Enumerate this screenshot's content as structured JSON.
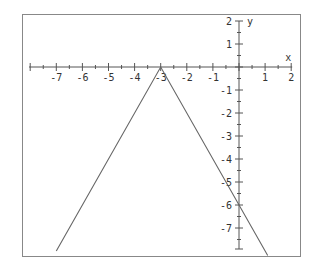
{
  "chart_data": {
    "type": "line",
    "title": "",
    "function": "y = -2|x + 3|",
    "xlabel": "x",
    "ylabel": "y",
    "xlim": [
      -8,
      2
    ],
    "ylim": [
      -8,
      2
    ],
    "grid": false,
    "x_ticks": [
      -7,
      -6,
      -5,
      -4,
      -3,
      -2,
      -1,
      1,
      2
    ],
    "y_ticks": [
      2,
      1,
      -1,
      -2,
      -3,
      -4,
      -5,
      -6,
      -7
    ],
    "x_tick_labels": [
      "-7",
      "-6",
      "-5",
      "-4",
      "-3",
      "-2",
      "-1",
      "1",
      "2"
    ],
    "y_tick_labels": [
      "2",
      "1",
      "-1",
      "-2",
      "-3",
      "-4",
      "-5",
      "-6",
      "-7"
    ],
    "series": [
      {
        "name": "graph",
        "x": [
          -7,
          -3,
          1.1
        ],
        "y": [
          -8,
          0,
          -8.2
        ]
      }
    ],
    "annotations": [
      {
        "text": "vertex",
        "x": -3,
        "y": 0
      },
      {
        "text": "y-intercept",
        "x": 0,
        "y": -6
      }
    ],
    "colors": {
      "axis": "#555555",
      "line": "#666666",
      "frame": "#888888"
    }
  }
}
